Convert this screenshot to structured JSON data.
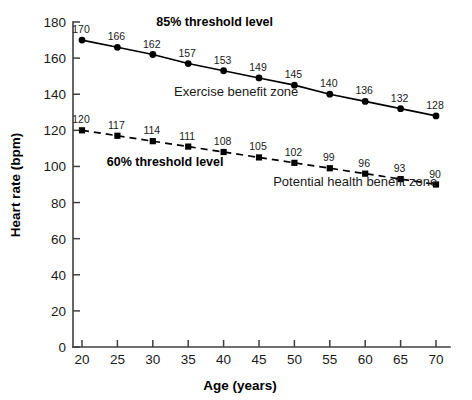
{
  "chart_data": {
    "type": "line",
    "title": "",
    "xlabel": "Age (years)",
    "ylabel": "Heart rate (bpm)",
    "x": [
      20,
      25,
      30,
      35,
      40,
      45,
      50,
      55,
      60,
      65,
      70
    ],
    "xlim": [
      20,
      70
    ],
    "ylim": [
      0,
      180
    ],
    "xticks": [
      20,
      25,
      30,
      35,
      40,
      45,
      50,
      55,
      60,
      65,
      70
    ],
    "yticks": [
      0,
      20,
      40,
      60,
      80,
      100,
      120,
      140,
      160,
      180
    ],
    "grid": false,
    "legend": "none",
    "series": [
      {
        "name": "85% threshold level",
        "marker": "circle",
        "linestyle": "solid",
        "color": "#000000",
        "values": [
          170,
          166,
          162,
          157,
          153,
          149,
          145,
          140,
          136,
          132,
          128
        ]
      },
      {
        "name": "60% threshold level",
        "marker": "square",
        "linestyle": "dashed",
        "color": "#000000",
        "values": [
          120,
          117,
          114,
          111,
          108,
          105,
          102,
          99,
          96,
          93,
          90
        ]
      }
    ],
    "annotations": [
      {
        "text": "85% threshold level",
        "x": 30.5,
        "y": 178,
        "style": "bold",
        "anchor": "start"
      },
      {
        "text": "60% threshold level",
        "x": 23.5,
        "y": 100,
        "style": "bold",
        "anchor": "start"
      },
      {
        "text": "Exercise benefit zone",
        "x": 33.0,
        "y": 139,
        "style": "plain",
        "anchor": "start"
      },
      {
        "text": "Potential health benefit zone",
        "x": 47.0,
        "y": 89,
        "style": "plain",
        "anchor": "start"
      }
    ]
  },
  "colors": {
    "axis": "#3f3f3f",
    "series": "#000000",
    "background": "#ffffff",
    "text": "#1a1a1a"
  }
}
